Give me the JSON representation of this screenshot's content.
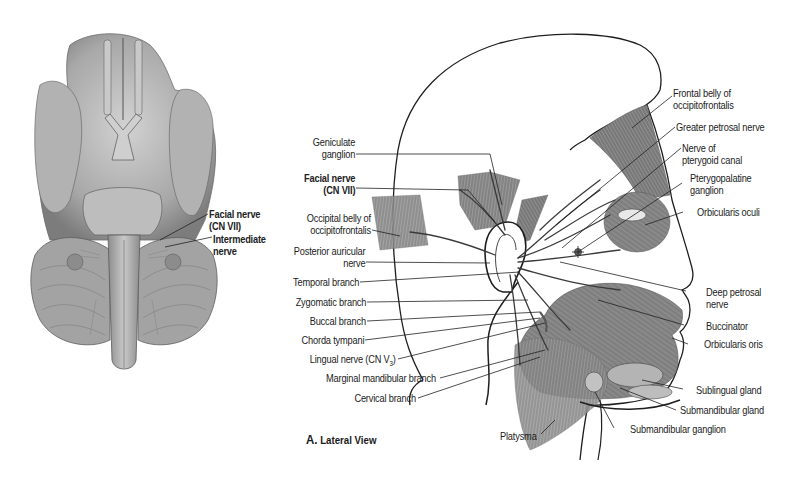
{
  "figure": {
    "caption_letter": "A.",
    "caption_text": "Lateral View",
    "inferior_view": {
      "labels": {
        "facial_nerve_line1": "Facial nerve",
        "facial_nerve_line2": "(CN VII)",
        "intermediate_line1": "Intermediate",
        "intermediate_line2": "nerve"
      }
    },
    "lateral_view": {
      "left_labels": {
        "geniculate_1": "Geniculate",
        "geniculate_2": "ganglion",
        "facial_1": "Facial nerve",
        "facial_2": "(CN VII)",
        "occipital_1": "Occipital belly of",
        "occipital_2": "occipitofrontalis",
        "post_auric_1": "Posterior auricular",
        "post_auric_2": "nerve",
        "temporal": "Temporal branch",
        "zygomatic": "Zygomatic branch",
        "buccal": "Buccal branch",
        "chorda": "Chorda tympani",
        "lingual": "Lingual nerve (CN V",
        "lingual_sub": "3",
        "lingual_end": ")",
        "marginal": "Marginal mandibular branch",
        "cervical": "Cervical branch"
      },
      "right_labels": {
        "frontal_1": "Frontal belly of",
        "frontal_2": "occipitofrontalis",
        "greater_petrosal": "Greater petrosal nerve",
        "pterygoid_canal_1": "Nerve of",
        "pterygoid_canal_2": "pterygoid canal",
        "pterygopalatine_1": "Pterygopalatine",
        "pterygopalatine_2": "ganglion",
        "orbicularis_oculi": "Orbicularis oculi",
        "deep_petrosal_1": "Deep petrosal",
        "deep_petrosal_2": "nerve",
        "buccinator": "Buccinator",
        "orbicularis_oris": "Orbicularis oris",
        "sublingual": "Sublingual gland",
        "submandibular_gland": "Submandibular gland",
        "submandibular_ganglion": "Submandibular ganglion",
        "platysma": "Platysma"
      }
    },
    "colors": {
      "ink": "#222222",
      "tissue": "#8a8a8a",
      "tissue_light": "#b8b8b8",
      "background": "#ffffff"
    }
  }
}
